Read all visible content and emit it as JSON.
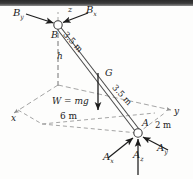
{
  "figure": {
    "background_color": "#fdfdfc",
    "line_color": "#3d3d3d",
    "dashed_color": "#9a9a9a",
    "arrow_color": "#1c1c1c",
    "top_band_color": "#2a2a2a"
  },
  "axes": [
    {
      "name": "x-axis-label",
      "text": "x",
      "x": 11,
      "y": 117
    },
    {
      "name": "y-axis-label",
      "text": "y",
      "x": 174,
      "y": 112
    },
    {
      "name": "z-axis-label",
      "text": "z",
      "x": 68,
      "y": 9
    }
  ],
  "points": [
    {
      "name": "point-b",
      "text": "B",
      "x": 53,
      "y": 31
    },
    {
      "name": "point-a",
      "text": "A",
      "x": 143,
      "y": 122
    },
    {
      "name": "point-g",
      "text": "G",
      "x": 105,
      "y": 72
    }
  ],
  "forces": [
    {
      "name": "force-by",
      "base": "B",
      "sub": "y",
      "x": 14,
      "y": 11
    },
    {
      "name": "force-bx",
      "base": "B",
      "sub": "x",
      "x": 86,
      "y": 8
    },
    {
      "name": "force-ax",
      "base": "A",
      "sub": "x",
      "x": 104,
      "y": 155
    },
    {
      "name": "force-az",
      "base": "A",
      "sub": "z",
      "x": 134,
      "y": 152
    },
    {
      "name": "force-ay",
      "base": "A",
      "sub": "y",
      "x": 157,
      "y": 146
    }
  ],
  "dimensions": [
    {
      "name": "dim-height-h",
      "text": "h",
      "x": 57,
      "y": 55,
      "italic": true
    },
    {
      "name": "dim-length-upper",
      "text": "3.5 m",
      "x": 72,
      "y": 33,
      "rotation": 48
    },
    {
      "name": "dim-length-lower",
      "text": "3.5 m",
      "x": 120,
      "y": 86,
      "rotation": 48
    },
    {
      "name": "dim-span-6m",
      "text": "6 m",
      "x": 61,
      "y": 115,
      "italic": false
    },
    {
      "name": "dim-span-2m",
      "text": "2 m",
      "x": 156,
      "y": 124,
      "italic": false
    }
  ],
  "weight": {
    "name": "weight-label",
    "text": "W = mg",
    "x": 52,
    "y": 100,
    "value_symbol": "mg"
  },
  "geometry": {
    "origin": [
      58,
      85
    ],
    "b_node": [
      58,
      25
    ],
    "a_node": [
      138,
      133
    ],
    "g_point": [
      98,
      79
    ],
    "node_radius": 4.2
  }
}
